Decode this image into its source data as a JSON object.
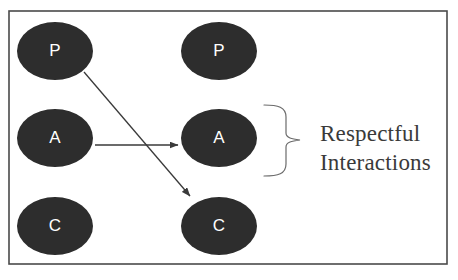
{
  "figure": {
    "background_color": "#ffffff",
    "frame": {
      "color": "#4a4a4a",
      "x": 9,
      "y": 11,
      "width": 438,
      "height": 253,
      "stroke_width": 1.6
    }
  },
  "nodes": {
    "fill_color": "#2d2d2d",
    "label_color": "#ffffff",
    "left_column": [
      {
        "label": "P",
        "cx": 55,
        "cy": 51,
        "rx": 38,
        "ry": 29
      },
      {
        "label": "A",
        "cx": 55,
        "cy": 138,
        "rx": 38,
        "ry": 29
      },
      {
        "label": "C",
        "cx": 55,
        "cy": 226,
        "rx": 38,
        "ry": 29
      }
    ],
    "right_column": [
      {
        "label": "P",
        "cx": 219,
        "cy": 51,
        "rx": 38,
        "ry": 29
      },
      {
        "label": "A",
        "cx": 219,
        "cy": 138,
        "rx": 38,
        "ry": 29
      },
      {
        "label": "C",
        "cx": 219,
        "cy": 226,
        "rx": 38,
        "ry": 29
      }
    ]
  },
  "arrows": {
    "color": "#3a3a3a",
    "stroke_width": 1.3,
    "items": [
      {
        "name": "adult-to-adult-arrow",
        "from_label": "A",
        "to_label": "A",
        "x1": 95,
        "y1": 145,
        "x2": 178,
        "y2": 145
      },
      {
        "name": "parent-to-child-arrow",
        "from_label": "P",
        "to_label": "C",
        "x1": 84,
        "y1": 72,
        "x2": 190,
        "y2": 196
      }
    ]
  },
  "brace": {
    "name": "grouping-brace",
    "color": "#6b6b6b",
    "stroke_width": 1.2,
    "top_y": 105,
    "bottom_y": 176,
    "left_x": 264,
    "spine_x": 286,
    "tip_x": 300,
    "tip_y": 140
  },
  "annotation": {
    "lines": [
      "Respectful",
      "Interactions"
    ],
    "color": "#3a3a3a",
    "x": 320,
    "line1_baseline": 141,
    "line2_baseline": 170
  }
}
